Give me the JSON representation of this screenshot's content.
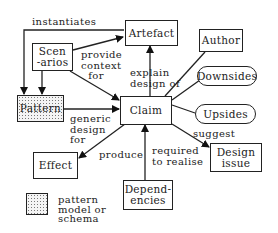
{
  "diagram": {
    "nodes": {
      "artefact": "Artefact",
      "author": "Author",
      "scenarios": "Scen\n-arios",
      "downsides": "Downsides",
      "pattern": "Pattern",
      "claim": "Claim",
      "upsides": "Upsides",
      "design_issue": "Design\nissue",
      "effect": "Effect",
      "dependencies": "Depend-\nencies"
    },
    "edges": {
      "instantiates": "instantiates",
      "provide_context_for": "provide\ncontext\n  for",
      "explain_design_of": "explain\ndesign of",
      "generic_design_for": "generic\ndesign\nfor",
      "suggest": "suggest",
      "produce": "produce",
      "required_to_realise": "required\nto realise"
    },
    "legend": {
      "swatch_label": "pattern\nmodel or\nschema"
    },
    "colors": {
      "stroke": "#222222",
      "pattern_fill": "#f4f4f4",
      "dots": "#777777"
    }
  }
}
